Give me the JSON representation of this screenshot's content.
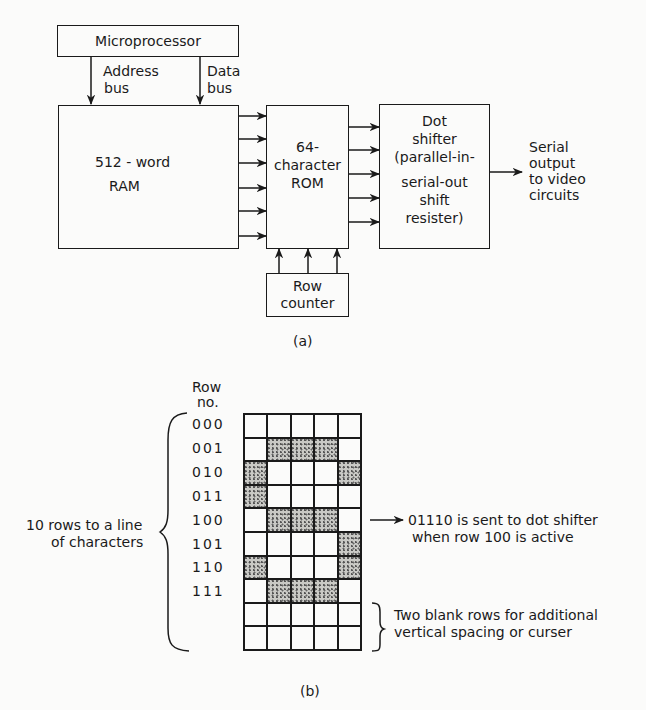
{
  "part_a": {
    "microprocessor": "Microprocessor",
    "address_bus": [
      "Address",
      "bus"
    ],
    "data_bus": [
      "Data",
      "bus"
    ],
    "ram": [
      "512 - word",
      "RAM"
    ],
    "rom": [
      "64-",
      "character",
      "ROM"
    ],
    "dot_shifter": [
      "Dot",
      "shifter",
      "(parallel-in-",
      "serial-out",
      "shift",
      "resister)"
    ],
    "row_counter": [
      "Row",
      "counter"
    ],
    "serial_output": [
      "Serial",
      "output",
      "to video",
      "circuits"
    ],
    "caption": "(a)",
    "ram_to_rom_lines": 6,
    "rom_to_shifter_lines": 5,
    "counter_to_rom_lines": 3
  },
  "part_b": {
    "row_header": [
      "Row",
      "no."
    ],
    "row_numbers": [
      "000",
      "001",
      "010",
      "011",
      "100",
      "101",
      "110",
      "111"
    ],
    "left_brace_label": [
      "10 rows to a line",
      "of characters"
    ],
    "note_row100": [
      "01110 is sent to dot shifter",
      "when row 100 is active"
    ],
    "note_blank": [
      "Two blank rows for additional",
      "vertical spacing or curser"
    ],
    "caption": "(b)",
    "dot_matrix": [
      [
        0,
        0,
        0,
        0,
        0
      ],
      [
        0,
        1,
        1,
        1,
        0
      ],
      [
        1,
        0,
        0,
        0,
        1
      ],
      [
        1,
        0,
        0,
        0,
        0
      ],
      [
        0,
        1,
        1,
        1,
        0
      ],
      [
        0,
        0,
        0,
        0,
        1
      ],
      [
        1,
        0,
        0,
        0,
        1
      ],
      [
        0,
        1,
        1,
        1,
        0
      ],
      [
        0,
        0,
        0,
        0,
        0
      ],
      [
        0,
        0,
        0,
        0,
        0
      ]
    ]
  }
}
